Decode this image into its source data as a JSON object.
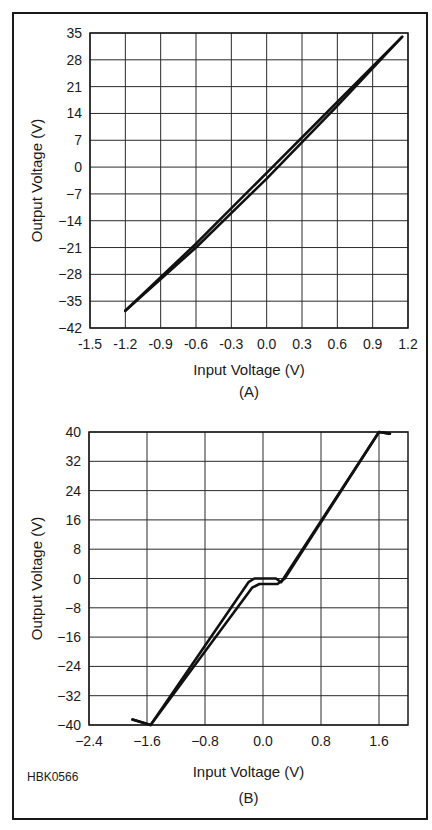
{
  "figure_code": "HBK0566",
  "chart_data": [
    {
      "type": "line",
      "panel": "(A)",
      "title": "",
      "xlabel": "Input Voltage (V)",
      "ylabel": "Output Voltage (V)",
      "xlim": [
        -1.5,
        1.2
      ],
      "ylim": [
        -42,
        35
      ],
      "xticks": [
        "-1.5",
        "-1.2",
        "-0.9",
        "-0.6",
        "-0.3",
        "0.0",
        "0.3",
        "0.6",
        "0.9",
        "1.2"
      ],
      "yticks": [
        "35",
        "28",
        "21",
        "14",
        "7",
        "0",
        "-7",
        "-14",
        "-21",
        "-28",
        "-35",
        "-42"
      ],
      "grid": true,
      "series": [
        {
          "name": "upper trace",
          "x": [
            -1.2,
            -0.6,
            0.0,
            0.6,
            1.15
          ],
          "y": [
            -37.5,
            -20.0,
            -1.5,
            17.0,
            34.0
          ]
        },
        {
          "name": "lower trace",
          "x": [
            -1.2,
            -0.6,
            0.0,
            0.6,
            1.15
          ],
          "y": [
            -37.5,
            -21.0,
            -3.0,
            16.0,
            34.0
          ]
        }
      ]
    },
    {
      "type": "line",
      "panel": "(B)",
      "title": "",
      "xlabel": "Input Voltage (V)",
      "ylabel": "Output Voltage (V)",
      "xlim": [
        -2.4,
        2.0
      ],
      "ylim": [
        -40,
        40
      ],
      "xticks": [
        "-2.4",
        "-1.6",
        "-0.8",
        "0.0",
        "0.8",
        "1.6"
      ],
      "yticks": [
        "40",
        "32",
        "24",
        "16",
        "8",
        "0",
        "-8",
        "-16",
        "-24",
        "-32",
        "-40"
      ],
      "grid": true,
      "series": [
        {
          "name": "upper trace",
          "x": [
            -1.8,
            -1.55,
            -0.2,
            -0.12,
            0.18,
            0.25,
            1.6,
            1.75
          ],
          "y": [
            -38.5,
            -40.0,
            -1.0,
            0.0,
            0.0,
            -1.0,
            40.0,
            39.5
          ]
        },
        {
          "name": "lower trace",
          "x": [
            -1.8,
            -1.55,
            -0.15,
            -0.05,
            0.2,
            0.3,
            1.6,
            1.75
          ],
          "y": [
            -38.5,
            -40.0,
            -2.5,
            -1.5,
            -1.5,
            0.0,
            40.0,
            39.5
          ]
        }
      ]
    }
  ]
}
